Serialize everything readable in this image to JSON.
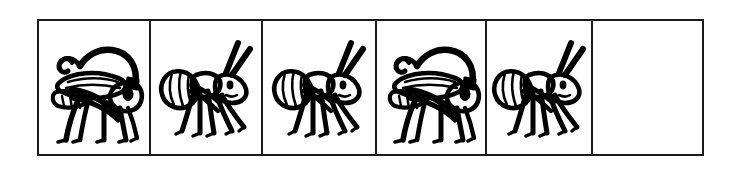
{
  "puzzle": {
    "type": "pattern-sequence",
    "row_count": 1,
    "cell_count": 6,
    "border_color": "#1a1a1a",
    "background_color": "#ffffff",
    "ink_color": "#000000",
    "cells": [
      {
        "index": 1,
        "content": "grasshopper",
        "icon": "grasshopper-icon",
        "empty": false
      },
      {
        "index": 2,
        "content": "ant",
        "icon": "ant-icon",
        "empty": false
      },
      {
        "index": 3,
        "content": "ant",
        "icon": "ant-icon",
        "empty": false
      },
      {
        "index": 4,
        "content": "grasshopper",
        "icon": "grasshopper-icon",
        "empty": false
      },
      {
        "index": 5,
        "content": "ant",
        "icon": "ant-icon",
        "empty": false
      },
      {
        "index": 6,
        "content": "",
        "icon": "empty-cell",
        "empty": true
      }
    ]
  }
}
